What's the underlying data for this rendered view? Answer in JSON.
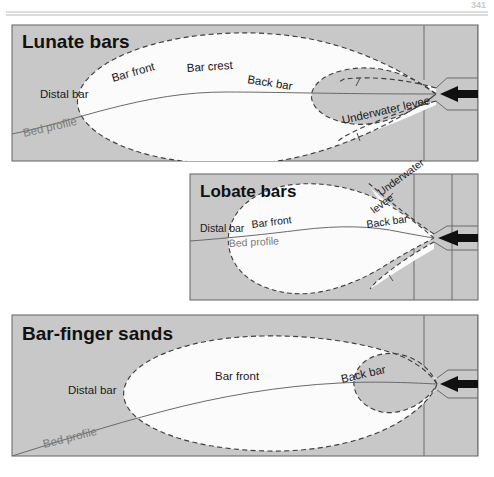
{
  "figure": {
    "kind": "geological-schematic-diagram",
    "page_header_number": "341",
    "background_color": "#ffffff",
    "panel_fill_color": "#c8c8c8",
    "bar_fill_color": "#fbfbfb",
    "panel_border_color": "#6e6e6e",
    "line_color": "#6a6a6a",
    "dashed_color": "#4a4a4a",
    "arrow_color": "#101010",
    "bed_profile_label_color": "#7b7b7b"
  },
  "panels": [
    {
      "id": "lunate-bars",
      "title": "Lunate bars",
      "labels": [
        {
          "id": "distal-bar",
          "text": "Distal bar",
          "x": 40,
          "y": 98,
          "rotate": 0,
          "size": 11.5
        },
        {
          "id": "bar-front",
          "text": "Bar front",
          "x": 113,
          "y": 82,
          "rotate": -16,
          "size": 11.5
        },
        {
          "id": "bar-crest",
          "text": "Bar crest",
          "x": 187,
          "y": 72,
          "rotate": -4,
          "size": 11.5
        },
        {
          "id": "back-bar",
          "text": "Back bar",
          "x": 247,
          "y": 83,
          "rotate": 9,
          "size": 11.5
        },
        {
          "id": "underwater-levee",
          "text": "Underwater levee",
          "x": 343,
          "y": 124,
          "rotate": -13,
          "size": 11.5
        },
        {
          "id": "bed-profile",
          "text": "Bed profile",
          "x": 24,
          "y": 137,
          "rotate": -13,
          "size": 11.5,
          "muted": true
        }
      ],
      "flow_arrow": {
        "id": "flow-arrow",
        "direction": "left",
        "x": 447,
        "y": 94
      }
    },
    {
      "id": "lobate-bars",
      "title": "Lobate bars",
      "labels": [
        {
          "id": "distal-bar",
          "text": "Distal bar",
          "x": 200,
          "y": 232,
          "rotate": 0,
          "size": 10.5
        },
        {
          "id": "bar-front",
          "text": "Bar front",
          "x": 252,
          "y": 228,
          "rotate": -7,
          "size": 10.5
        },
        {
          "id": "back-bar",
          "text": "Back bar",
          "x": 367,
          "y": 228,
          "rotate": -8,
          "size": 10.5
        },
        {
          "id": "underwater-upper",
          "text": "Underwater",
          "x": 381,
          "y": 196,
          "rotate": -36,
          "size": 10.5
        },
        {
          "id": "underwater-lower",
          "text": "levee",
          "x": 374,
          "y": 214,
          "rotate": -36,
          "size": 10.5
        },
        {
          "id": "bed-profile",
          "text": "Bed profile",
          "x": 229,
          "y": 247,
          "rotate": -3,
          "size": 10.5,
          "muted": true
        }
      ],
      "flow_arrow": {
        "id": "flow-arrow",
        "direction": "left",
        "x": 447,
        "y": 238
      }
    },
    {
      "id": "bar-finger-sands",
      "title": "Bar-finger sands",
      "labels": [
        {
          "id": "distal-bar",
          "text": "Distal bar",
          "x": 68,
          "y": 394,
          "rotate": 0,
          "size": 11.5
        },
        {
          "id": "bar-front",
          "text": "Bar front",
          "x": 215,
          "y": 380,
          "rotate": 0,
          "size": 11.5
        },
        {
          "id": "back-bar",
          "text": "Back bar",
          "x": 342,
          "y": 383,
          "rotate": -13,
          "size": 11.5
        },
        {
          "id": "bed-profile",
          "text": "Bed profile",
          "x": 44,
          "y": 448,
          "rotate": -14,
          "size": 11.5,
          "muted": true
        }
      ],
      "flow_arrow": {
        "id": "flow-arrow",
        "direction": "left",
        "x": 447,
        "y": 384
      }
    }
  ]
}
